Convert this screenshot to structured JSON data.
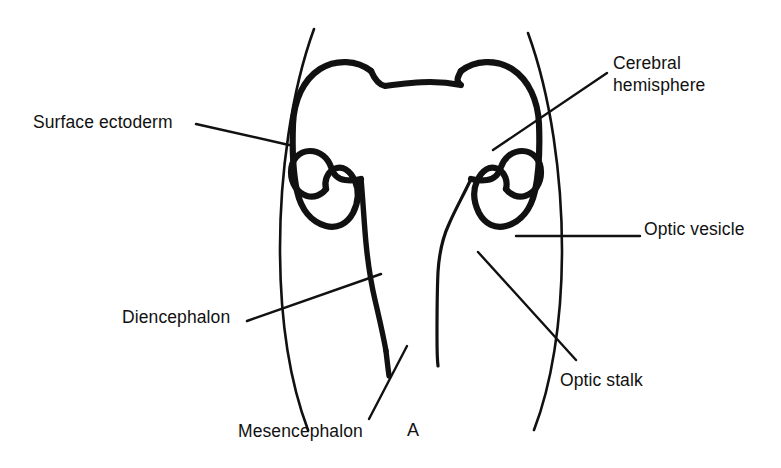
{
  "figure": {
    "panel_letter": "A",
    "background_color": "#ffffff",
    "ink_color": "#111111",
    "title": ""
  },
  "labels": {
    "surface_ectoderm": "Surface ectoderm",
    "cerebral_hemisphere_line1": "Cerebral",
    "cerebral_hemisphere_line2": "hemisphere",
    "optic_vesicle": "Optic vesicle",
    "optic_stalk": "Optic stalk",
    "diencephalon": "Diencephalon",
    "mesencephalon": "Mesencephalon"
  },
  "structures": [
    {
      "name": "surface-ectoderm",
      "label": "Surface ectoderm"
    },
    {
      "name": "cerebral-hemisphere",
      "label": "Cerebral hemisphere"
    },
    {
      "name": "optic-vesicle",
      "label": "Optic vesicle"
    },
    {
      "name": "optic-stalk",
      "label": "Optic stalk"
    },
    {
      "name": "diencephalon",
      "label": "Diencephalon"
    },
    {
      "name": "mesencephalon",
      "label": "Mesencephalon"
    }
  ]
}
